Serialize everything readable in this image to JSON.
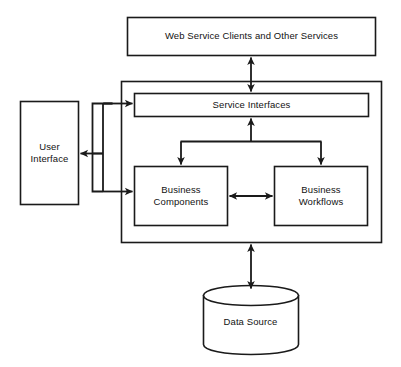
{
  "diagram": {
    "type": "architecture-block-diagram",
    "background_color": "#ffffff",
    "stroke_color": "#1a1a1a",
    "text_color": "#121212",
    "nodes": [
      {
        "id": "web-service-clients",
        "label": "Web Service Clients and Other Services",
        "shape": "rectangle",
        "x": 127,
        "y": 17,
        "w": 249,
        "h": 39
      },
      {
        "id": "application-container",
        "label": "",
        "shape": "rectangle",
        "x": 121,
        "y": 81,
        "w": 261,
        "h": 162
      },
      {
        "id": "service-interfaces",
        "label": "Service Interfaces",
        "shape": "rectangle",
        "x": 134,
        "y": 93,
        "w": 235,
        "h": 24
      },
      {
        "id": "user-interface",
        "label": "User\nInterface",
        "shape": "rectangle",
        "x": 20,
        "y": 101,
        "w": 59,
        "h": 104
      },
      {
        "id": "business-components",
        "label": "Business\nComponents",
        "shape": "rectangle",
        "x": 134,
        "y": 166,
        "w": 94,
        "h": 60
      },
      {
        "id": "business-workflows",
        "label": "Business\nWorkflows",
        "shape": "rectangle",
        "x": 274,
        "y": 166,
        "w": 94,
        "h": 60
      },
      {
        "id": "data-source",
        "label": "Data Source",
        "shape": "cylinder",
        "x": 203,
        "y": 288,
        "w": 95,
        "h": 64
      }
    ],
    "connectors": [
      {
        "id": "clients-to-service-interfaces",
        "from": "web-service-clients",
        "to": "service-interfaces",
        "direction": "bidirectional",
        "orientation": "vertical"
      },
      {
        "id": "service-interfaces-to-business-components",
        "from": "service-interfaces",
        "to": "business-components",
        "direction": "forward",
        "orientation": "fork-down"
      },
      {
        "id": "service-interfaces-to-business-workflows",
        "from": "service-interfaces",
        "to": "business-workflows",
        "direction": "forward",
        "orientation": "fork-down"
      },
      {
        "id": "business-components-to-business-workflows",
        "from": "business-components",
        "to": "business-workflows",
        "direction": "bidirectional",
        "orientation": "horizontal"
      },
      {
        "id": "user-interface-to-service-interfaces",
        "from": "user-interface",
        "to": "service-interfaces",
        "direction": "forward",
        "orientation": "elbow"
      },
      {
        "id": "user-interface-to-business-components",
        "from": "user-interface",
        "to": "business-components",
        "direction": "forward",
        "orientation": "elbow"
      },
      {
        "id": "application-to-user-interface",
        "from": "application-container",
        "to": "user-interface",
        "direction": "forward",
        "orientation": "horizontal"
      },
      {
        "id": "application-to-data-source",
        "from": "application-container",
        "to": "data-source",
        "direction": "bidirectional",
        "orientation": "vertical"
      }
    ]
  }
}
